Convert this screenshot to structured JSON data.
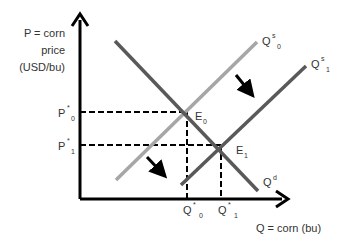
{
  "diagram": {
    "y_axis_label": [
      "P = corn",
      "price",
      "(USD/bu)"
    ],
    "x_axis_label": "Q = corn (bu)",
    "price_labels": [
      {
        "base": "P",
        "sup": "*",
        "sub": "0"
      },
      {
        "base": "P",
        "sup": "*",
        "sub": "1"
      }
    ],
    "quantity_labels": [
      {
        "base": "Q",
        "sup": "*",
        "sub": "0"
      },
      {
        "base": "Q",
        "sup": "*",
        "sub": "1"
      }
    ],
    "curves": [
      {
        "id": "supply-0",
        "base": "Q",
        "sup": "s",
        "sub": "0",
        "color": "#a6a6a6"
      },
      {
        "id": "supply-1",
        "base": "Q",
        "sup": "s",
        "sub": "1",
        "color": "#595959"
      },
      {
        "id": "demand",
        "base": "Q",
        "sup": "d",
        "sub": "",
        "color": "#595959"
      }
    ],
    "equilibria": [
      {
        "base": "E",
        "sub": "0"
      },
      {
        "base": "E",
        "sub": "1"
      }
    ],
    "shift_arrows": [
      "supply-shift-right-arrow-upper",
      "supply-shift-right-arrow-lower"
    ],
    "colors": {
      "axis": "#000000",
      "light_supply": "#a6a6a6",
      "dark_line": "#595959",
      "text": "#333333"
    }
  }
}
